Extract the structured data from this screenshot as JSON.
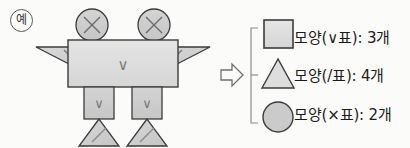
{
  "example_badge": {
    "label": "예",
    "icon": "circled-example-marker"
  },
  "arrow": {
    "glyph": "⇒",
    "name": "implies-arrow"
  },
  "colors": {
    "background": "#fbfbfa",
    "shape_fill_light": "#dedede",
    "shape_fill_mid": "#cfcfcf",
    "shape_fill_dark": "#c3c3c3",
    "stroke": "#3c3c3c",
    "mark_stroke": "#6e6e6e",
    "bracket": "#8c8c8c",
    "text": "#1c1c1c"
  },
  "figure": {
    "name": "robot-composed-of-shapes",
    "parts": [
      {
        "name": "head-left",
        "shape": "circle",
        "mark": "×"
      },
      {
        "name": "head-right",
        "shape": "circle",
        "mark": "×"
      },
      {
        "name": "wing-left",
        "shape": "triangle",
        "mark": "/"
      },
      {
        "name": "wing-right",
        "shape": "triangle",
        "mark": "/"
      },
      {
        "name": "body",
        "shape": "rectangle",
        "mark": "∨"
      },
      {
        "name": "leg-left",
        "shape": "rectangle",
        "mark": "∨"
      },
      {
        "name": "leg-right",
        "shape": "rectangle",
        "mark": "∨"
      },
      {
        "name": "foot-left",
        "shape": "triangle",
        "mark": "/"
      },
      {
        "name": "foot-right",
        "shape": "triangle",
        "mark": "/"
      }
    ],
    "marks": {
      "body": "∨",
      "leg_left": "∨",
      "leg_right": "∨",
      "head_left": "×",
      "head_right": "×"
    }
  },
  "legend": {
    "name": "shape-count-legend",
    "rows": [
      {
        "icon": "square-icon",
        "shape": "square",
        "text": "모양(∨표): 3개",
        "mark": "∨",
        "count": 3,
        "unit": "개"
      },
      {
        "icon": "triangle-icon",
        "shape": "triangle",
        "text": "모양(/표): 4개",
        "mark": "/",
        "count": 4,
        "unit": "개"
      },
      {
        "icon": "circle-icon",
        "shape": "circle",
        "text": "모양(×표): 2개",
        "mark": "×",
        "count": 2,
        "unit": "개"
      }
    ]
  }
}
